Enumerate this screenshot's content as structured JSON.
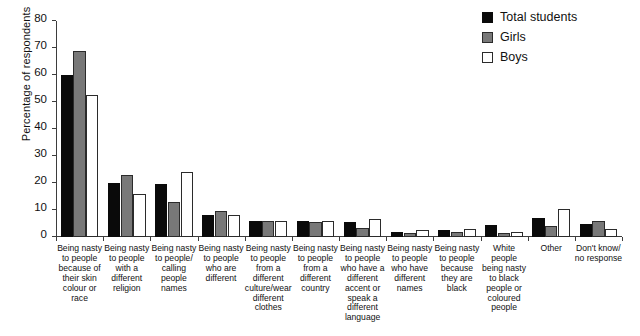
{
  "chart_data": {
    "type": "bar",
    "title": "",
    "xlabel": "",
    "ylabel": "Percentage of respondents",
    "ylim": [
      0,
      80
    ],
    "yticks": [
      0,
      10,
      20,
      30,
      40,
      50,
      60,
      70,
      80
    ],
    "ytick_labels": [
      "0",
      "10",
      "20",
      "30",
      "40",
      "50",
      "60",
      "70",
      "80"
    ],
    "grid": false,
    "legend_position": "top-right",
    "categories": [
      "Being nasty to people because of their skin colour or race",
      "Being nasty to people with a different religion",
      "Being nasty to people/ calling people names",
      "Being nasty to people who are different",
      "Being nasty to people from a different culture/wear different clothes",
      "Being nasty to people from a different country",
      "Being nasty to people who have a different accent or speak a different language",
      "Being nasty to people who have different names",
      "Being nasty to people because they are black",
      "White people being nasty to black people or coloured people",
      "Other",
      "Don't know/ no response"
    ],
    "series": [
      {
        "name": "Total students",
        "color": "#0a0a0a",
        "values": [
          60,
          20,
          19.5,
          8,
          6,
          6,
          5.5,
          2,
          2.5,
          4.5,
          7,
          5
        ]
      },
      {
        "name": "Girls",
        "color": "#787878",
        "values": [
          69,
          23,
          13,
          9.5,
          6,
          5.5,
          3.5,
          1.5,
          2,
          1.5,
          4,
          6
        ]
      },
      {
        "name": "Boys",
        "color": "#ffffff",
        "values": [
          52.5,
          16,
          24,
          8,
          6,
          6,
          6.5,
          2.5,
          3,
          2,
          10.5,
          3
        ]
      }
    ]
  },
  "legend": {
    "entries": [
      {
        "label": "Total students",
        "swatch": "black-filled-square"
      },
      {
        "label": "Girls",
        "swatch": "gray-filled-square"
      },
      {
        "label": "Boys",
        "swatch": "white-outline-square"
      }
    ]
  }
}
